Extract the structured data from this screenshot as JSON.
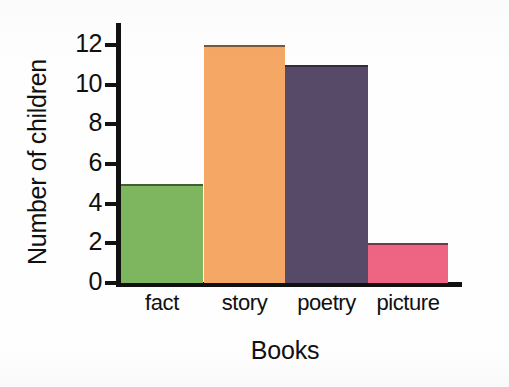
{
  "chart_data": {
    "type": "bar",
    "title": "",
    "xlabel": "Books",
    "ylabel": "Number of children",
    "categories": [
      "fact",
      "story",
      "poetry",
      "picture"
    ],
    "values": [
      5,
      12,
      11,
      2
    ],
    "colors": [
      "#7EB55F",
      "#F5A765",
      "#564A68",
      "#EE6583"
    ],
    "ylim": [
      0,
      13
    ],
    "ytick_labels": [
      "0",
      "2",
      "4",
      "6",
      "8",
      "10",
      "12"
    ],
    "ytick_values": [
      0,
      2,
      4,
      6,
      8,
      10,
      12
    ],
    "grid": false,
    "legend": null,
    "axis_color": "#111111",
    "background": "#FEFEFE"
  },
  "axes": {
    "y_title": "Number of children",
    "x_title": "Books"
  },
  "bars": [
    {
      "category": "fact",
      "value": 5,
      "color": "#7EB55F"
    },
    {
      "category": "story",
      "value": 12,
      "color": "#F5A765"
    },
    {
      "category": "poetry",
      "value": 11,
      "color": "#564A68"
    },
    {
      "category": "picture",
      "value": 2,
      "color": "#EE6583"
    }
  ]
}
